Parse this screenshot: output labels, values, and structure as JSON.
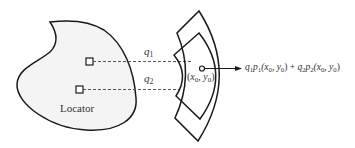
{
  "diagram": {
    "locator_label": "Locator",
    "weights": [
      {
        "symbol": "q",
        "index": "1"
      },
      {
        "symbol": "q",
        "index": "2"
      }
    ],
    "point_label": {
      "open": "(",
      "x": "x",
      "x_sub": "0",
      "sep": ", ",
      "y": "y",
      "y_sub": "0",
      "close": ")"
    },
    "output_expression": {
      "term1": {
        "q": "q",
        "q_sub": "1",
        "p": "p",
        "p_sub": "1",
        "args": "(x",
        "ax_sub": "0",
        "mid": ", y",
        "ay_sub": "0",
        "end": ")"
      },
      "plus": " + ",
      "term2": {
        "q": "q",
        "q_sub": "2",
        "p": "p",
        "p_sub": "2",
        "args": "(x",
        "ax_sub": "0",
        "mid": ", y",
        "ay_sub": "0",
        "end": ")"
      }
    },
    "colors": {
      "stroke": "#1a1a1a",
      "blob_fill": "#f4f4f4",
      "dashed": "#555555"
    }
  }
}
